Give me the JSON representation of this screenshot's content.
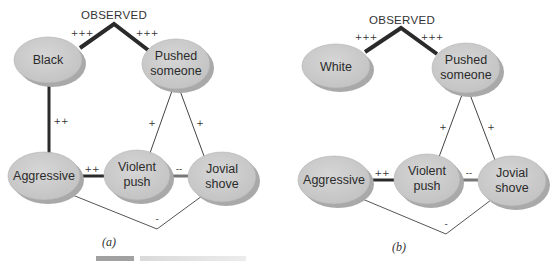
{
  "figure": {
    "panels": [
      {
        "id": "a",
        "label": "(a)",
        "observed_label": "OBSERVED",
        "nodes": {
          "race": "Black",
          "pushed_line1": "Pushed",
          "pushed_line2": "someone",
          "aggressive": "Aggressive",
          "violent_line1": "Violent",
          "violent_line2": "push",
          "jovial_line1": "Jovial",
          "jovial_line2": "shove"
        },
        "edges": {
          "observed_race": "+++",
          "observed_pushed": "+++",
          "race_aggressive": "++",
          "pushed_violent": "+",
          "pushed_jovial": "+",
          "aggressive_violent": "++",
          "violent_jovial": "--",
          "aggressive_jovial": "-"
        }
      },
      {
        "id": "b",
        "label": "(b)",
        "observed_label": "OBSERVED",
        "nodes": {
          "race": "White",
          "pushed_line1": "Pushed",
          "pushed_line2": "someone",
          "aggressive": "Aggressive",
          "violent_line1": "Violent",
          "violent_line2": "push",
          "jovial_line1": "Jovial",
          "jovial_line2": "shove"
        },
        "edges": {
          "observed_race": "+++",
          "observed_pushed": "+++",
          "pushed_violent": "+",
          "pushed_jovial": "+",
          "aggressive_violent": "++",
          "violent_jovial": "--",
          "aggressive_jovial": "-"
        }
      }
    ],
    "colors": {
      "node_fill": "#c9c9c9",
      "node_shadow": "#a9a9a9",
      "strong_edge": "#2a2a2a",
      "thin_edge": "#444444"
    }
  }
}
